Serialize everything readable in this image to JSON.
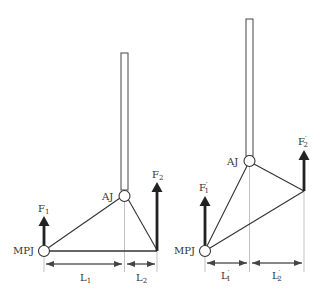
{
  "diagram": {
    "left": {
      "joint_proximal": "MPJ",
      "joint_distal": "AJ",
      "force_1": {
        "base": "F",
        "sub": "1",
        "prime": ""
      },
      "force_2": {
        "base": "F",
        "sub": "2",
        "prime": ""
      },
      "length_1": {
        "base": "L",
        "sub": "1",
        "prime": ""
      },
      "length_2": {
        "base": "L",
        "sub": "2",
        "prime": ""
      }
    },
    "right": {
      "joint_proximal": "MPJ",
      "joint_distal": "AJ",
      "force_1": {
        "base": "F",
        "sub": "1",
        "prime": "′"
      },
      "force_2": {
        "base": "F",
        "sub": "2",
        "prime": "′"
      },
      "length_1": {
        "base": "L",
        "sub": "1",
        "prime": "′"
      },
      "length_2": {
        "base": "L",
        "sub": "2",
        "prime": "′"
      }
    },
    "colors": {
      "line": "#333333",
      "arrow": "#222222",
      "guide": "#999999"
    }
  }
}
